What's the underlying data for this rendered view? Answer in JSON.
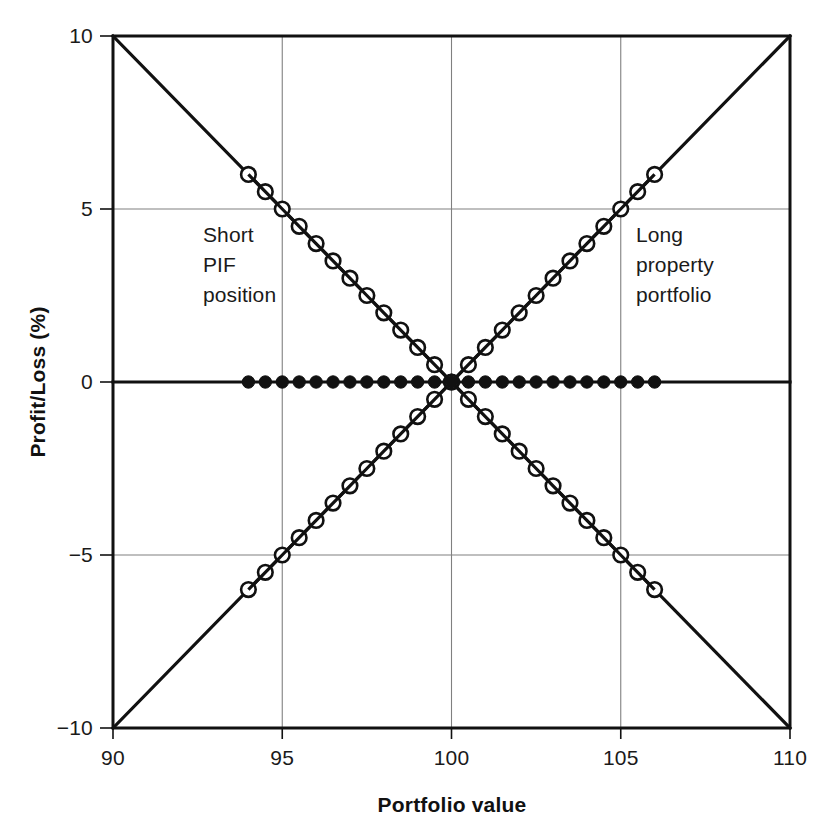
{
  "chart_data": {
    "type": "line",
    "title": "",
    "xlabel": "Portfolio value",
    "ylabel": "Profit/Loss (%)",
    "xlim": [
      90,
      110
    ],
    "ylim": [
      -10,
      10
    ],
    "xticks": [
      90,
      95,
      100,
      105,
      110
    ],
    "yticks": [
      10,
      5,
      0,
      -5,
      -10
    ],
    "xtick_labels": [
      "90",
      "95",
      "100",
      "105",
      "110"
    ],
    "ytick_labels": [
      "10",
      "5",
      "0",
      "−5",
      "−10"
    ],
    "grid": true,
    "grid_x": [
      95,
      100,
      105
    ],
    "grid_y": [
      5,
      0,
      -5
    ],
    "legend": "none",
    "series": [
      {
        "name": "Long property portfolio",
        "marker": "open-circle",
        "line_x": [
          90,
          110
        ],
        "line_y": [
          -10,
          10
        ],
        "marker_x": [
          94,
          94.5,
          95,
          95.5,
          96,
          96.5,
          97,
          97.5,
          98,
          98.5,
          99,
          99.5,
          100,
          100.5,
          101,
          101.5,
          102,
          102.5,
          103,
          103.5,
          104,
          104.5,
          105,
          105.5,
          106
        ],
        "marker_y": [
          -6,
          -5.5,
          -5,
          -4.5,
          -4,
          -3.5,
          -3,
          -2.5,
          -2,
          -1.5,
          -1,
          -0.5,
          0,
          0.5,
          1,
          1.5,
          2,
          2.5,
          3,
          3.5,
          4,
          4.5,
          5,
          5.5,
          6
        ]
      },
      {
        "name": "Short PIF position",
        "marker": "open-circle",
        "line_x": [
          90,
          110
        ],
        "line_y": [
          10,
          -10
        ],
        "marker_x": [
          94,
          94.5,
          95,
          95.5,
          96,
          96.5,
          97,
          97.5,
          98,
          98.5,
          99,
          99.5,
          100,
          100.5,
          101,
          101.5,
          102,
          102.5,
          103,
          103.5,
          104,
          104.5,
          105,
          105.5,
          106
        ],
        "marker_y": [
          6,
          5.5,
          5,
          4.5,
          4,
          3.5,
          3,
          2.5,
          2,
          1.5,
          1,
          0.5,
          0,
          -0.5,
          -1,
          -1.5,
          -2,
          -2.5,
          -3,
          -3.5,
          -4,
          -4.5,
          -5,
          -5.5,
          -6
        ]
      },
      {
        "name": "Hedged position",
        "marker": "filled-circle",
        "line_x": [
          90,
          110
        ],
        "line_y": [
          0,
          0
        ],
        "marker_x": [
          94,
          94.5,
          95,
          95.5,
          96,
          96.5,
          97,
          97.5,
          98,
          98.5,
          99,
          99.5,
          100,
          100.5,
          101,
          101.5,
          102,
          102.5,
          103,
          103.5,
          104,
          104.5,
          105,
          105.5,
          106
        ],
        "marker_y": [
          0,
          0,
          0,
          0,
          0,
          0,
          0,
          0,
          0,
          0,
          0,
          0,
          0,
          0,
          0,
          0,
          0,
          0,
          0,
          0,
          0,
          0,
          0,
          0,
          0
        ]
      }
    ],
    "annotations": [
      {
        "id": "short",
        "lines": [
          "Short",
          "PIF",
          "position"
        ],
        "x": 96,
        "y": 4.1
      },
      {
        "id": "long",
        "lines": [
          "Long",
          "property",
          "portfolio"
        ],
        "x": 105.5,
        "y": 4.1
      }
    ],
    "colors": {
      "line": "#111111",
      "grid": "#808080",
      "axis": "#111111",
      "background": "#ffffff",
      "text": "#1a1a1a"
    }
  }
}
